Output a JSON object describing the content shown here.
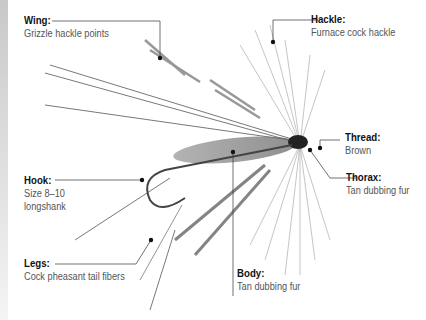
{
  "diagram": {
    "labels": [
      {
        "id": "wing",
        "title": "Wing:",
        "desc": [
          "Grizzle hackle points"
        ]
      },
      {
        "id": "hackle",
        "title": "Hackle:",
        "desc": [
          "Furnace cock hackle"
        ]
      },
      {
        "id": "thread",
        "title": "Thread:",
        "desc": [
          "Brown"
        ]
      },
      {
        "id": "thorax",
        "title": "Thorax:",
        "desc": [
          "Tan dubbing fur"
        ]
      },
      {
        "id": "hook",
        "title": "Hook:",
        "desc": [
          "Size 8–10",
          "longshank"
        ]
      },
      {
        "id": "legs",
        "title": "Legs:",
        "desc": [
          "Cock pheasant tail fibers"
        ]
      },
      {
        "id": "body",
        "title": "Body:",
        "desc": [
          "Tan dubbing fur"
        ]
      }
    ]
  }
}
